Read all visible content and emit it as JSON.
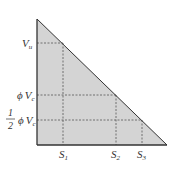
{
  "diagram": {
    "type": "shear-diagram-triangle",
    "fill_color": "#d4d4d4",
    "stroke_color": "#333333",
    "dash_color": "#555555",
    "y_labels": {
      "vu": {
        "main": "V",
        "sub": "u"
      },
      "phi_vc": {
        "phi": "ϕ",
        "main": "V",
        "sub": "c"
      },
      "half_phi_vc": {
        "num": "1",
        "den": "2",
        "phi": "ϕ",
        "main": "V",
        "sub": "c"
      }
    },
    "x_labels": [
      {
        "main": "S",
        "sub": "1"
      },
      {
        "main": "S",
        "sub": "2"
      },
      {
        "main": "S",
        "sub": "3"
      }
    ]
  }
}
